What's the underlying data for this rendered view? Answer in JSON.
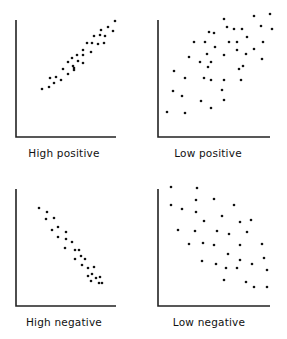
{
  "chart_data": [
    {
      "type": "scatter",
      "title": "High positive",
      "xlabel": "",
      "ylabel": "",
      "grid": false,
      "frame": {
        "x0": 16,
        "y0": 20,
        "x1": 116,
        "y1": 137
      },
      "points": [
        [
          42,
          89
        ],
        [
          49,
          87
        ],
        [
          50,
          78
        ],
        [
          54,
          83
        ],
        [
          56,
          77
        ],
        [
          61,
          80
        ],
        [
          63,
          69
        ],
        [
          68,
          74
        ],
        [
          68,
          62
        ],
        [
          72,
          58
        ],
        [
          73,
          66
        ],
        [
          74,
          68
        ],
        [
          74,
          70
        ],
        [
          77,
          55
        ],
        [
          78,
          61
        ],
        [
          83,
          63
        ],
        [
          83,
          50
        ],
        [
          83,
          55
        ],
        [
          87,
          43
        ],
        [
          91,
          52
        ],
        [
          92,
          43
        ],
        [
          94,
          36
        ],
        [
          98,
          44
        ],
        [
          100,
          35
        ],
        [
          101,
          30
        ],
        [
          104,
          43
        ],
        [
          105,
          36
        ],
        [
          108,
          27
        ],
        [
          113,
          31
        ],
        [
          115,
          21
        ]
      ]
    },
    {
      "type": "scatter",
      "title": "Low positive",
      "xlabel": "",
      "ylabel": "",
      "grid": false,
      "frame": {
        "x0": 158,
        "y0": 20,
        "x1": 270,
        "y1": 137
      },
      "points": [
        [
          167,
          112
        ],
        [
          174,
          71
        ],
        [
          173,
          91
        ],
        [
          185,
          113
        ],
        [
          185,
          78
        ],
        [
          182,
          96
        ],
        [
          189,
          57
        ],
        [
          194,
          42
        ],
        [
          200,
          62
        ],
        [
          201,
          101
        ],
        [
          204,
          78
        ],
        [
          205,
          42
        ],
        [
          207,
          54
        ],
        [
          208,
          67
        ],
        [
          209,
          32
        ],
        [
          211,
          108
        ],
        [
          211,
          62
        ],
        [
          211,
          80
        ],
        [
          214,
          33
        ],
        [
          215,
          47
        ],
        [
          222,
          90
        ],
        [
          224,
          80
        ],
        [
          224,
          55
        ],
        [
          224,
          100
        ],
        [
          224,
          19
        ],
        [
          227,
          27
        ],
        [
          229,
          42
        ],
        [
          234,
          29
        ],
        [
          237,
          50
        ],
        [
          237,
          42
        ],
        [
          239,
          69
        ],
        [
          241,
          80
        ],
        [
          242,
          29
        ],
        [
          243,
          66
        ],
        [
          247,
          37
        ],
        [
          246,
          54
        ],
        [
          254,
          16
        ],
        [
          254,
          49
        ],
        [
          261,
          26
        ],
        [
          262,
          59
        ],
        [
          263,
          42
        ],
        [
          270,
          14
        ],
        [
          272,
          29
        ]
      ]
    },
    {
      "type": "scatter",
      "title": "High negative",
      "xlabel": "",
      "ylabel": "",
      "grid": false,
      "frame": {
        "x0": 16,
        "y0": 189,
        "x1": 116,
        "y1": 306
      },
      "points": [
        [
          39,
          208
        ],
        [
          47,
          212
        ],
        [
          46,
          219
        ],
        [
          54,
          218
        ],
        [
          52,
          230
        ],
        [
          58,
          227
        ],
        [
          58,
          237
        ],
        [
          66,
          232
        ],
        [
          66,
          239
        ],
        [
          65,
          248
        ],
        [
          72,
          242
        ],
        [
          75,
          250
        ],
        [
          75,
          259
        ],
        [
          79,
          250
        ],
        [
          81,
          256
        ],
        [
          85,
          259
        ],
        [
          82,
          265
        ],
        [
          88,
          268
        ],
        [
          94,
          267
        ],
        [
          88,
          276
        ],
        [
          92,
          274
        ],
        [
          91,
          281
        ],
        [
          96,
          278
        ],
        [
          100,
          277
        ],
        [
          99,
          283
        ],
        [
          102,
          283
        ]
      ]
    },
    {
      "type": "scatter",
      "title": "Low negative",
      "xlabel": "",
      "ylabel": "",
      "grid": false,
      "frame": {
        "x0": 158,
        "y0": 189,
        "x1": 270,
        "y1": 306
      },
      "points": [
        [
          171,
          187
        ],
        [
          197,
          188
        ],
        [
          171,
          205
        ],
        [
          196,
          200
        ],
        [
          214,
          199
        ],
        [
          234,
          205
        ],
        [
          182,
          209
        ],
        [
          196,
          212
        ],
        [
          222,
          216
        ],
        [
          204,
          221
        ],
        [
          240,
          222
        ],
        [
          251,
          220
        ],
        [
          178,
          230
        ],
        [
          195,
          231
        ],
        [
          217,
          231
        ],
        [
          229,
          234
        ],
        [
          247,
          232
        ],
        [
          189,
          244
        ],
        [
          203,
          243
        ],
        [
          214,
          245
        ],
        [
          240,
          245
        ],
        [
          262,
          244
        ],
        [
          228,
          254
        ],
        [
          240,
          260
        ],
        [
          202,
          261
        ],
        [
          216,
          264
        ],
        [
          226,
          268
        ],
        [
          237,
          268
        ],
        [
          252,
          264
        ],
        [
          264,
          258
        ],
        [
          267,
          270
        ],
        [
          224,
          280
        ],
        [
          246,
          282
        ],
        [
          254,
          287
        ],
        [
          267,
          287
        ]
      ]
    }
  ],
  "labels": {
    "high_positive": "High positive",
    "low_positive": "Low positive",
    "high_negative": "High negative",
    "low_negative": "Low negative"
  },
  "label_positions": [
    {
      "key": "high_positive",
      "x": 64,
      "y": 157
    },
    {
      "key": "low_positive",
      "x": 208,
      "y": 157
    },
    {
      "key": "high_negative",
      "x": 64,
      "y": 326
    },
    {
      "key": "low_negative",
      "x": 209,
      "y": 326
    }
  ]
}
